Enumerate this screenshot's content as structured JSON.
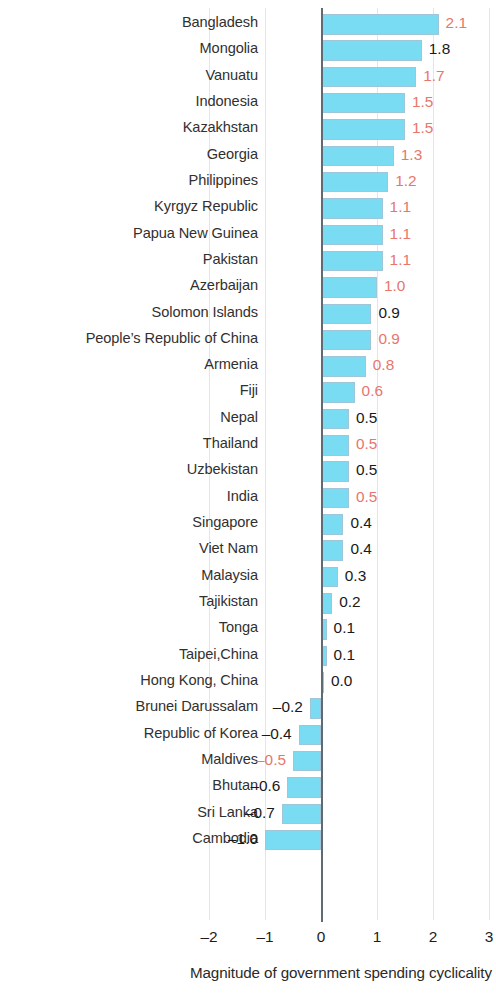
{
  "chart_data": {
    "type": "bar",
    "orientation": "horizontal",
    "title": "",
    "xlabel": "Magnitude of government spending cyclicality",
    "ylabel": "",
    "xlim": [
      -2,
      3
    ],
    "xticks": [
      -2,
      -1,
      0,
      1,
      2,
      3
    ],
    "xtick_labels": [
      "–2",
      "–1",
      "0",
      "1",
      "2",
      "3"
    ],
    "grid": true,
    "legend": null,
    "bar_color": "#79dcf2",
    "bar_border_color": "#9fc5d8",
    "label_color_highlight": "#e8766c",
    "label_color_normal": "#191919",
    "categories": [
      "Bangladesh",
      "Mongolia",
      "Vanuatu",
      "Indonesia",
      "Kazakhstan",
      "Georgia",
      "Philippines",
      "Kyrgyz Republic",
      "Papua New Guinea",
      "Pakistan",
      "Azerbaijan",
      "Solomon Islands",
      "People’s Republic of China",
      "Armenia",
      "Fiji",
      "Nepal",
      "Thailand",
      "Uzbekistan",
      "India",
      "Singapore",
      "Viet Nam",
      "Malaysia",
      "Tajikistan",
      "Tonga",
      "Taipei,China",
      "Hong Kong, China",
      "Brunei Darussalam",
      "Republic of Korea",
      "Maldives",
      "Bhutan",
      "Sri Lanka",
      "Cambodia"
    ],
    "values": [
      2.1,
      1.8,
      1.7,
      1.5,
      1.5,
      1.3,
      1.2,
      1.1,
      1.1,
      1.1,
      1.0,
      0.9,
      0.9,
      0.8,
      0.6,
      0.5,
      0.5,
      0.5,
      0.5,
      0.4,
      0.4,
      0.3,
      0.2,
      0.1,
      0.1,
      0.0,
      -0.2,
      -0.4,
      -0.5,
      -0.6,
      -0.7,
      -1.0
    ],
    "value_labels": [
      "2.1",
      "1.8",
      "1.7",
      "1.5",
      "1.5",
      "1.3",
      "1.2",
      "1.1",
      "1.1",
      "1.1",
      "1.0",
      "0.9",
      "0.9",
      "0.8",
      "0.6",
      "0.5",
      "0.5",
      "0.5",
      "0.5",
      "0.4",
      "0.4",
      "0.3",
      "0.2",
      "0.1",
      "0.1",
      "0.0",
      "–0.2",
      "–0.4",
      "–0.5",
      "–0.6",
      "–0.7",
      "–1.0"
    ],
    "value_label_colors": [
      "red",
      "black",
      "red",
      "red",
      "red",
      "red",
      "red",
      "red",
      "red",
      "red",
      "red",
      "black",
      "red",
      "red",
      "red",
      "black",
      "red",
      "black",
      "red",
      "black",
      "black",
      "black",
      "black",
      "black",
      "black",
      "black",
      "black",
      "black",
      "red",
      "black",
      "black",
      "black"
    ]
  }
}
